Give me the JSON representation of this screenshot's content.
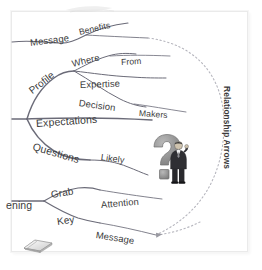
{
  "diagram": {
    "type": "mind-map",
    "background_color": "#ffffff",
    "frame_border_color": "#eaeaea",
    "branch_color": "#6b6b78",
    "label_color": "#3a3a3a",
    "accent_gray": "#8c8c8c"
  },
  "annotation": {
    "relationship_arrows": "Relationship Arrows"
  },
  "branches": [
    {
      "id": "message-benefits",
      "labels": [
        {
          "key": "message",
          "text": "Message",
          "x": 30,
          "y": 37,
          "rot": -7,
          "size": 9.5
        },
        {
          "key": "benefits",
          "text": "Benefits",
          "x": 79,
          "y": 27,
          "rot": -13,
          "size": 8.6
        }
      ]
    },
    {
      "id": "profile",
      "labels": [
        {
          "key": "profile",
          "text": "Profile",
          "x": 30,
          "y": 86,
          "rot": -38,
          "size": 10
        },
        {
          "key": "where",
          "text": "Where",
          "x": 72,
          "y": 58,
          "rot": -14,
          "size": 9.4
        },
        {
          "key": "from",
          "text": "From",
          "x": 121,
          "y": 57,
          "rot": -3,
          "size": 8.6
        },
        {
          "key": "expertise",
          "text": "Expertise",
          "x": 80,
          "y": 79,
          "rot": -2,
          "size": 9.4
        },
        {
          "key": "decision",
          "text": "Decision",
          "x": 79,
          "y": 97,
          "rot": 8,
          "size": 9.4
        },
        {
          "key": "makers",
          "text": "Makers",
          "x": 139,
          "y": 108,
          "rot": 4,
          "size": 8.6
        }
      ]
    },
    {
      "id": "expectations",
      "labels": [
        {
          "key": "expectations",
          "text": "Expectations",
          "x": 36,
          "y": 117,
          "rot": -4,
          "size": 10.5
        }
      ]
    },
    {
      "id": "questions",
      "labels": [
        {
          "key": "questions",
          "text": "Questions",
          "x": 33,
          "y": 140,
          "rot": 16,
          "size": 10.5
        },
        {
          "key": "likely",
          "text": "Likely",
          "x": 101,
          "y": 152,
          "rot": 8,
          "size": 9
        }
      ]
    },
    {
      "id": "opening",
      "labels": [
        {
          "key": "opening",
          "text": "ening",
          "x": 6,
          "y": 199,
          "rot": 0,
          "size": 10.5
        },
        {
          "key": "grab",
          "text": "Grab",
          "x": 51,
          "y": 189,
          "rot": -9,
          "size": 10
        },
        {
          "key": "attention",
          "text": "Attention",
          "x": 101,
          "y": 199,
          "rot": -5,
          "size": 9.4
        },
        {
          "key": "key",
          "text": "Key",
          "x": 57,
          "y": 216,
          "rot": -8,
          "size": 10
        },
        {
          "key": "message_end",
          "text": "Message",
          "x": 96,
          "y": 229,
          "rot": 9,
          "size": 9.4
        }
      ]
    }
  ],
  "icons": {
    "question_mark": "question-mark-3d",
    "businessman": "businessman-figure",
    "book": "open-book-icon"
  }
}
